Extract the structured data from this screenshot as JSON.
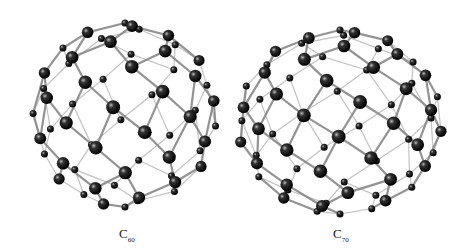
{
  "figure": {
    "molecules": [
      {
        "formula": "C",
        "subscript": "60",
        "label": "C60",
        "cx": 125,
        "cy": 115,
        "r": 92,
        "atoms": 60
      },
      {
        "formula": "C",
        "subscript": "70",
        "label": "C70",
        "cx": 340,
        "cy": 122,
        "rx": 102,
        "ry": 92,
        "atoms": 70
      }
    ],
    "colors": {
      "atom": "#1a1a1a",
      "bond": "#888888",
      "background": "#ffffff"
    }
  }
}
